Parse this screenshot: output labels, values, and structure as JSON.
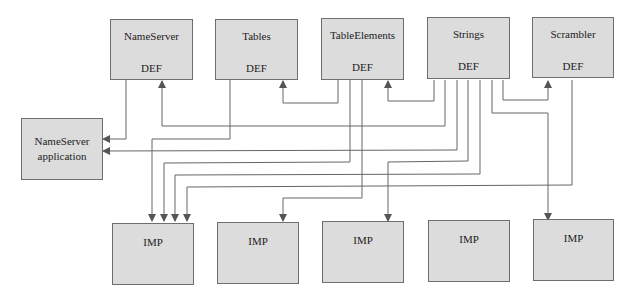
{
  "def_modules": [
    {
      "name": "NameServer",
      "kind": "DEF"
    },
    {
      "name": "Tables",
      "kind": "DEF"
    },
    {
      "name": "TableElements",
      "kind": "DEF"
    },
    {
      "name": "Strings",
      "kind": "DEF"
    },
    {
      "name": "Scrambler",
      "kind": "DEF"
    }
  ],
  "application": {
    "line1": "NameServer",
    "line2": "application"
  },
  "imp_modules": [
    {
      "kind": "IMP"
    },
    {
      "kind": "IMP"
    },
    {
      "kind": "IMP"
    },
    {
      "kind": "IMP"
    },
    {
      "kind": "IMP"
    }
  ],
  "colors": {
    "box_fill": "#dcdcdc",
    "box_border": "#6e6e6e",
    "wire": "#555555"
  }
}
